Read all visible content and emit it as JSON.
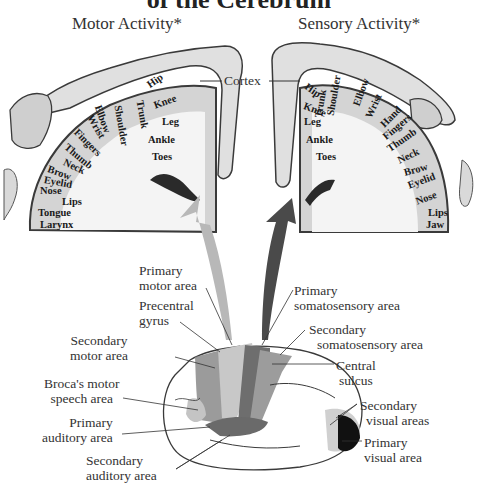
{
  "figure": {
    "title_partial": "of the Cerebrum",
    "motor_panel": {
      "title": "Motor Activity*",
      "homunculus_labels": [
        "Hip",
        "Knee",
        "Leg",
        "Ankle",
        "Toes",
        "Trunk",
        "Shoulder",
        "Elbow",
        "Wrist",
        "Fingers",
        "Thumb",
        "Neck",
        "Brow",
        "Eyelid",
        "Nose",
        "Lips",
        "Tongue",
        "Larynx"
      ]
    },
    "sensory_panel": {
      "title": "Sensory Activity*",
      "homunculus_labels": [
        "Hip",
        "Knee",
        "Leg",
        "Ankle",
        "Toes",
        "Trunk",
        "Shoulder",
        "Elbow",
        "Wrist",
        "Hand",
        "Fingers",
        "Thumb",
        "Neck",
        "Brow",
        "Eyelid",
        "Nose",
        "Lips",
        "Jaw"
      ]
    },
    "shared_label": "Cortex",
    "brain_labels": {
      "primary_motor_area": [
        "Primary",
        "motor area"
      ],
      "precentral_gyrus": [
        "Precentral",
        "gyrus"
      ],
      "secondary_motor_area": [
        "Secondary",
        "motor area"
      ],
      "brocas_area": [
        "Broca's motor",
        "speech area"
      ],
      "primary_auditory_area": [
        "Primary",
        "auditory area"
      ],
      "secondary_auditory_area": [
        "Secondary",
        "auditory area"
      ],
      "primary_somatosensory_area": [
        "Primary",
        "somatosensory area"
      ],
      "secondary_somatosensory_area": [
        "Secondary",
        "somatosensory area"
      ],
      "central_sulcus": [
        "Central",
        "sulcus"
      ],
      "secondary_visual_areas": [
        "Secondary",
        "visual areas"
      ],
      "primary_visual_area": [
        "Primary",
        "visual area"
      ]
    },
    "colors": {
      "motor_arrow": "#b8b8b8",
      "sensory_arrow": "#4a4a4a",
      "cortex_fill": "#d4d4d4",
      "outline": "#3a3a3a"
    }
  }
}
